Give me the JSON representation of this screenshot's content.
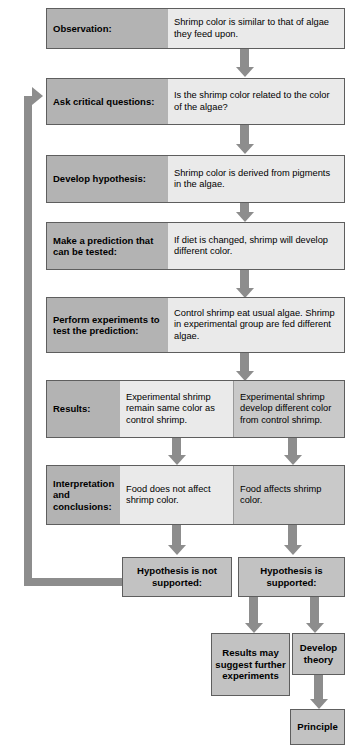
{
  "diagram": {
    "colors": {
      "label_gray": "#b3b3b3",
      "detail_light": "#eaeaea",
      "detail_medium": "#c9c9c9",
      "arrow_gray": "#8d8d8d",
      "border": "#5e5e5e",
      "terminal_box": "#c2c2c2",
      "background": "#ffffff"
    },
    "steps": [
      {
        "label": "Observation:",
        "detail": "Shrimp color is similar to that of algae they feed upon."
      },
      {
        "label": "Ask critical questions:",
        "detail": "Is the shrimp color related to the color of the algae?"
      },
      {
        "label": "Develop hypothesis:",
        "detail": "Shrimp color is derived from pigments in the algae."
      },
      {
        "label": "Make a prediction that can be tested:",
        "detail": "If diet is changed, shrimp will develop different color."
      },
      {
        "label": "Perform experiments to test the prediction:",
        "detail": "Control shrimp eat usual algae. Shrimp in experimental group are fed different algae."
      }
    ],
    "results": {
      "label": "Results:",
      "left": "Experimental shrimp remain same color as control shrimp.",
      "right": "Experimental shrimp develop different color from control shrimp."
    },
    "interpretation": {
      "label": "Interpretation and conclusions:",
      "left": "Food does not affect shrimp color.",
      "right": "Food affects shrimp color."
    },
    "outcomes": {
      "not_supported": "Hypothesis is not supported:",
      "supported": "Hypothesis is supported:"
    },
    "terminals": {
      "further_experiments": "Results may suggest further experiments",
      "develop_theory": "Develop theory",
      "principle": "Principle"
    }
  }
}
